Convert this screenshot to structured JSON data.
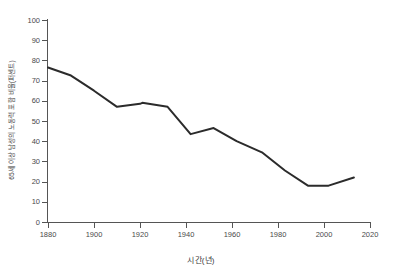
{
  "chart_data": {
    "type": "line",
    "title": "",
    "xlabel": "시간(년)",
    "ylabel": "65세 이상 남성의 노동력 포함 비율(퍼센트)",
    "xlim": [
      1880,
      2020
    ],
    "ylim": [
      0,
      100
    ],
    "grid": false,
    "legend": null,
    "xticks": [
      1880,
      1900,
      1920,
      1940,
      1960,
      1980,
      2000,
      2020
    ],
    "yticks": [
      0,
      10,
      20,
      30,
      40,
      50,
      60,
      70,
      80,
      90,
      100
    ],
    "xtick_labels": [
      "1880",
      "1900",
      "1920",
      "1940",
      "1960",
      "1980",
      "2000",
      "2020"
    ],
    "ytick_labels": [
      "0",
      "10",
      "20",
      "30",
      "40",
      "50",
      "60",
      "70",
      "80",
      "90",
      "100"
    ],
    "line_color": "#2b2b2b",
    "line_width": 2,
    "series": [
      {
        "name": "65세 이상 남성의 노동력 포함 비율",
        "x": [
          1880,
          1890,
          1900,
          1910,
          1920,
          1921,
          1932,
          1942,
          1952,
          1962,
          1973,
          1983,
          1993,
          2002,
          2013
        ],
        "values": [
          76.5,
          72.5,
          65.0,
          57.0,
          58.5,
          59.0,
          57.0,
          43.5,
          46.5,
          40.0,
          34.5,
          25.5,
          18.0,
          18.0,
          22.0
        ]
      }
    ]
  },
  "axes": {
    "y_tick_label_0": "0",
    "y_tick_label_1": "10",
    "y_tick_label_2": "20",
    "y_tick_label_3": "30",
    "y_tick_label_4": "40",
    "y_tick_label_5": "50",
    "y_tick_label_6": "60",
    "y_tick_label_7": "70",
    "y_tick_label_8": "80",
    "y_tick_label_9": "90",
    "y_tick_label_10": "100"
  }
}
